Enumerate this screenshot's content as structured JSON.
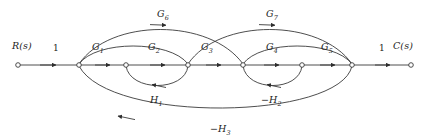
{
  "diagram": {
    "type": "signal-flow-graph",
    "title": "",
    "line_color": "#3a3a3a",
    "text_color": "#1b1b1b",
    "node_fill": "#ffffff",
    "baseline_y": 65,
    "nodes": [
      {
        "id": "n1",
        "label": "R(s)",
        "x": 18,
        "y": 65,
        "label_x": 12,
        "label_y": 42
      },
      {
        "id": "n2",
        "label": "",
        "x": 79,
        "y": 65
      },
      {
        "id": "n3",
        "label": "",
        "x": 126,
        "y": 65
      },
      {
        "id": "n4",
        "label": "",
        "x": 188,
        "y": 65
      },
      {
        "id": "n5",
        "label": "",
        "x": 243,
        "y": 65
      },
      {
        "id": "n6",
        "label": "",
        "x": 302,
        "y": 65
      },
      {
        "id": "n7",
        "label": "",
        "x": 352,
        "y": 65
      },
      {
        "id": "n8",
        "label": "C(s)",
        "x": 411,
        "y": 65,
        "label_x": 393,
        "label_y": 42
      }
    ],
    "edge_labels": {
      "input_gain": "1",
      "output_gain": "1",
      "g1": "G",
      "g1_sub": "1",
      "g2": "G",
      "g2_sub": "2",
      "g3": "G",
      "g3_sub": "3",
      "g4": "G",
      "g4_sub": "4",
      "g5": "G",
      "g5_sub": "5",
      "g6": "G",
      "g6_sub": "6",
      "g7": "G",
      "g7_sub": "7",
      "h1": "H",
      "h1_sub": "1",
      "h2": "−H",
      "h2_sub": "2",
      "h3": "−H",
      "h3_sub": "3"
    },
    "edges": [
      {
        "name": "edge-input-1",
        "from": "n1",
        "to": "n2",
        "gain": "1",
        "shape": "straight"
      },
      {
        "name": "edge-g1",
        "from": "n2",
        "to": "n3",
        "gain": "G1",
        "shape": "straight"
      },
      {
        "name": "edge-g2",
        "from": "n3",
        "to": "n4",
        "gain": "G2",
        "shape": "straight"
      },
      {
        "name": "edge-g3",
        "from": "n4",
        "to": "n5",
        "gain": "G3",
        "shape": "straight"
      },
      {
        "name": "edge-g4",
        "from": "n5",
        "to": "n6",
        "gain": "G4",
        "shape": "straight"
      },
      {
        "name": "edge-g5",
        "from": "n6",
        "to": "n7",
        "gain": "G5",
        "shape": "straight"
      },
      {
        "name": "edge-output-1",
        "from": "n7",
        "to": "n8",
        "gain": "1",
        "shape": "straight"
      },
      {
        "name": "edge-g6",
        "from": "n2",
        "to": "n5",
        "gain": "G6",
        "shape": "arc-above"
      },
      {
        "name": "edge-g7",
        "from": "n4",
        "to": "n7",
        "gain": "G7",
        "shape": "arc-above"
      },
      {
        "name": "edge-inner-left",
        "from": "n2",
        "to": "n4",
        "gain": "",
        "shape": "arc-above-small"
      },
      {
        "name": "edge-inner-right",
        "from": "n5",
        "to": "n7",
        "gain": "",
        "shape": "arc-above-small"
      },
      {
        "name": "edge-h1",
        "from": "n4",
        "to": "n3",
        "gain": "H1",
        "shape": "arc-below-small"
      },
      {
        "name": "edge-h2",
        "from": "n6",
        "to": "n5",
        "gain": "-H2",
        "shape": "arc-below-small"
      },
      {
        "name": "edge-h3",
        "from": "n7",
        "to": "n2",
        "gain": "-H3",
        "shape": "arc-below-large"
      }
    ]
  },
  "labels": {
    "r_of_s": "R(s)",
    "c_of_s": "C(s)",
    "one_left": "1",
    "one_right": "1"
  }
}
